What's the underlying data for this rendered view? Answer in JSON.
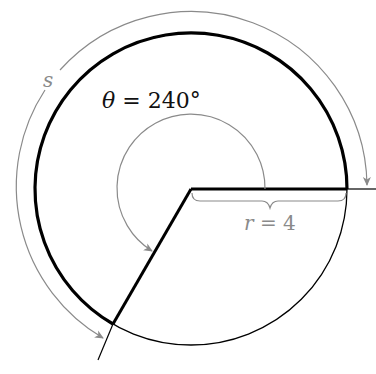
{
  "diagram": {
    "angle_label": {
      "symbol": "θ",
      "rest": " = 240°"
    },
    "radius_label": {
      "symbol": "r",
      "rest": " = 4"
    },
    "arc_label": "s",
    "geometry": {
      "center": [
        191,
        189
      ],
      "circle_radius": 156,
      "outer_arc_radius": 176,
      "angle_arc_radius": 74,
      "angle_degrees": 240
    },
    "colors": {
      "primary_stroke": "#000000",
      "annotation_stroke": "#8a8a8a"
    }
  }
}
